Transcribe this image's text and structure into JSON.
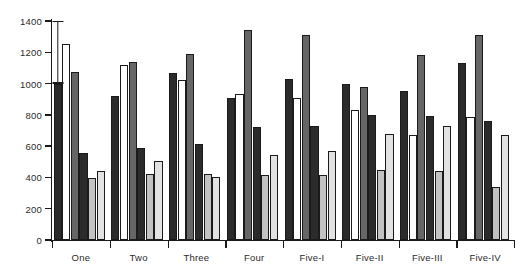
{
  "chart_data": {
    "type": "bar",
    "title": "",
    "xlabel": "",
    "ylabel": "",
    "ylim": [
      0,
      1400
    ],
    "yticks": [
      0,
      200,
      400,
      600,
      800,
      1000,
      1200,
      1400
    ],
    "grid": false,
    "legend": "none",
    "categories": [
      "One",
      "Two",
      "Three",
      "Four",
      "Five-I",
      "Five-II",
      "Five-III",
      "Five-IV"
    ],
    "series": [
      {
        "name": "Series 1",
        "color": "#2b2b2b",
        "values": [
          1000,
          920,
          1065,
          905,
          1030,
          1000,
          950,
          1130
        ]
      },
      {
        "name": "Series 2",
        "color": "#ffffff",
        "values": [
          1250,
          1120,
          1020,
          935,
          910,
          830,
          670,
          785
        ]
      },
      {
        "name": "Series 3",
        "color": "#666666",
        "values": [
          1075,
          1135,
          1190,
          1340,
          1310,
          980,
          1185,
          1310
        ]
      },
      {
        "name": "Series 4",
        "color": "#2b2b2b",
        "values": [
          555,
          590,
          615,
          725,
          730,
          800,
          790,
          760
        ]
      },
      {
        "name": "Series 5",
        "color": "#c2c2c2",
        "values": [
          395,
          420,
          420,
          415,
          415,
          445,
          440,
          340
        ]
      },
      {
        "name": "Series 6",
        "color": "#e2e2e2",
        "values": [
          440,
          505,
          400,
          545,
          570,
          680,
          730,
          670
        ]
      }
    ],
    "annotations": [
      {
        "name": "error-bar",
        "type": "error-bar",
        "group": "One",
        "low": 1000,
        "high": 1400
      }
    ]
  }
}
